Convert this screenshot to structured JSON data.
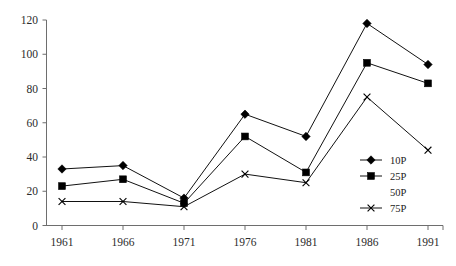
{
  "chart_data": {
    "type": "line",
    "title": "",
    "subtitle": "",
    "xlabel": "",
    "ylabel": "",
    "categories": [
      "1961",
      "1966",
      "1971",
      "1976",
      "1981",
      "1986",
      "1991"
    ],
    "x_tick_labels": [
      "1961",
      "1966",
      "1971",
      "1976",
      "1981",
      "1986",
      "1991"
    ],
    "y_tick_labels": [
      "0",
      "20",
      "40",
      "60",
      "80",
      "100",
      "120"
    ],
    "y_ticks": [
      0,
      20,
      40,
      60,
      80,
      100,
      120
    ],
    "ylim": [
      0,
      120
    ],
    "grid": false,
    "legend_position": "inside-right",
    "series": [
      {
        "name": "10P",
        "marker": "diamond",
        "plotted": true,
        "values": [
          33,
          35,
          16,
          65,
          52,
          118,
          94
        ]
      },
      {
        "name": "25P",
        "marker": "square",
        "plotted": true,
        "values": [
          23,
          27,
          13,
          52,
          31,
          95,
          83
        ]
      },
      {
        "name": "50P",
        "marker": "none",
        "plotted": false,
        "values": [
          null,
          null,
          null,
          null,
          null,
          null,
          null
        ]
      },
      {
        "name": "75P",
        "marker": "cross",
        "plotted": true,
        "values": [
          14,
          14,
          11,
          30,
          25,
          75,
          44
        ]
      }
    ]
  },
  "legend": {
    "entries": [
      {
        "label": "10P",
        "marker": "diamond"
      },
      {
        "label": "25P",
        "marker": "square"
      },
      {
        "label": "50P",
        "marker": "none"
      },
      {
        "label": "75P",
        "marker": "cross"
      }
    ]
  },
  "colors": {
    "series_line": "#111111",
    "marker": "#000000",
    "axis": "#6e6e6e",
    "background": "#ffffff",
    "text": "#1a1a1a"
  },
  "ghost_text": ""
}
